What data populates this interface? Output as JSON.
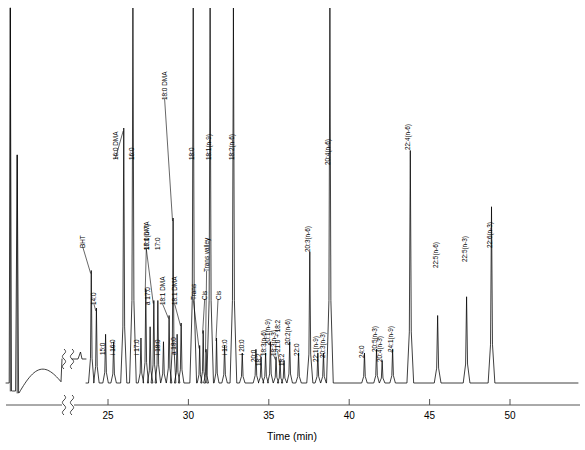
{
  "chart_data": {
    "type": "line",
    "title": "",
    "xlabel": "Time (min)",
    "ylabel": "",
    "xlim": [
      22.2,
      52.8
    ],
    "ylim": [
      0,
      100
    ],
    "grid": false,
    "legend": null,
    "x_ticks": [
      25,
      30,
      35,
      40,
      45,
      50
    ],
    "x_tick_labels": [
      "25",
      "30",
      "35",
      "40",
      "45",
      "50"
    ],
    "axis_break": true,
    "axis_break_note": "broken x-axis between solvent front region and 22.5 min",
    "series_name": "FID response",
    "peaks": [
      {
        "label": "",
        "rt": 22.3,
        "height": 100,
        "clipped": true,
        "width": 0.1
      },
      {
        "label": "",
        "rt": 22.78,
        "height": 88,
        "clipped": true,
        "width": 0.09
      },
      {
        "label": "BHT",
        "rt": 23.96,
        "height": 30,
        "clipped": false,
        "width": 0.09
      },
      {
        "label": "14:0",
        "rt": 24.28,
        "height": 20,
        "clipped": false,
        "width": 0.09
      },
      {
        "label": "15:0",
        "rt": 24.85,
        "height": 13,
        "clipped": false,
        "width": 0.09
      },
      {
        "label": "i 16:0",
        "rt": 25.35,
        "height": 11,
        "clipped": false,
        "width": 0.09
      },
      {
        "label": "16:0 DMA",
        "rt": 25.98,
        "height": 68,
        "clipped": false,
        "width": 0.1
      },
      {
        "label": "16:0",
        "rt": 26.55,
        "height": 100,
        "clipped": true,
        "width": 0.11
      },
      {
        "label": "i 17:0",
        "rt": 27.05,
        "height": 12,
        "clipped": false,
        "width": 0.09
      },
      {
        "label": "17:0 DMA",
        "rt": 27.35,
        "height": 25,
        "clipped": false,
        "width": 0.09
      },
      {
        "label": "a 17:0",
        "rt": 27.62,
        "height": 15,
        "clipped": false,
        "width": 0.09
      },
      {
        "label": "16:1(n-7)",
        "rt": 27.85,
        "height": 22,
        "clipped": false,
        "width": 0.09
      },
      {
        "label": "17:0",
        "rt": 28.1,
        "height": 22,
        "clipped": false,
        "width": 0.09
      },
      {
        "label": "i 18:0",
        "rt": 28.45,
        "height": 11,
        "clipped": false,
        "width": 0.09
      },
      {
        "label": "18:1 DMA",
        "rt": 28.8,
        "height": 18,
        "clipped": false,
        "width": 0.09
      },
      {
        "label": "18:0 DMA",
        "rt": 29.05,
        "height": 44,
        "clipped": false,
        "width": 0.09
      },
      {
        "label": "a 18:0",
        "rt": 29.3,
        "height": 13,
        "clipped": false,
        "width": 0.09
      },
      {
        "label": "18:1 DMA",
        "rt": 29.55,
        "height": 16,
        "clipped": false,
        "width": 0.09
      },
      {
        "label": "18:0",
        "rt": 30.3,
        "height": 100,
        "clipped": true,
        "width": 0.11
      },
      {
        "label": "Trans",
        "rt": 30.7,
        "height": 10,
        "clipped": false,
        "width": 0.08
      },
      {
        "label": "Cis",
        "rt": 30.92,
        "height": 14,
        "clipped": false,
        "width": 0.08
      },
      {
        "label": "Trans valley",
        "rt": 31.1,
        "height": 9,
        "clipped": false,
        "width": 0.08
      },
      {
        "label": "18:1(n-9)",
        "rt": 31.35,
        "height": 100,
        "clipped": true,
        "width": 0.11
      },
      {
        "label": "Cis",
        "rt": 31.75,
        "height": 12,
        "clipped": false,
        "width": 0.08
      },
      {
        "label": "i 19:0",
        "rt": 32.25,
        "height": 10,
        "clipped": false,
        "width": 0.09
      },
      {
        "label": "18:2(n-6)",
        "rt": 32.8,
        "height": 100,
        "clipped": true,
        "width": 0.11
      },
      {
        "label": "i 20:0",
        "rt": 33.35,
        "height": 8,
        "clipped": false,
        "width": 0.09
      },
      {
        "label": "20:0",
        "rt": 34.2,
        "height": 9,
        "clipped": false,
        "width": 0.09
      },
      {
        "label": "18:2",
        "rt": 34.52,
        "height": 7,
        "clipped": false,
        "width": 0.09
      },
      {
        "label": "18:3(n-6)",
        "rt": 34.8,
        "height": 8,
        "clipped": false,
        "width": 0.09
      },
      {
        "label": "20:1(n-9)",
        "rt": 35.1,
        "height": 11,
        "clipped": false,
        "width": 0.09
      },
      {
        "label": "18:3(n-3)",
        "rt": 35.45,
        "height": 7,
        "clipped": false,
        "width": 0.09
      },
      {
        "label": "21:0 + 18:2",
        "rt": 35.7,
        "height": 6,
        "clipped": false,
        "width": 0.09
      },
      {
        "label": "18:2",
        "rt": 35.95,
        "height": 6,
        "clipped": false,
        "width": 0.09
      },
      {
        "label": "20:2(n-6)",
        "rt": 36.3,
        "height": 11,
        "clipped": false,
        "width": 0.09
      },
      {
        "label": "22:0",
        "rt": 36.85,
        "height": 8,
        "clipped": false,
        "width": 0.09
      },
      {
        "label": "20:3(n-6)",
        "rt": 37.55,
        "height": 35,
        "clipped": false,
        "width": 0.1
      },
      {
        "label": "22:1(n-9)",
        "rt": 38.05,
        "height": 8,
        "clipped": false,
        "width": 0.09
      },
      {
        "label": "20:3(n-3)",
        "rt": 38.4,
        "height": 8,
        "clipped": false,
        "width": 0.09
      },
      {
        "label": "20:4(n-6)",
        "rt": 38.8,
        "height": 100,
        "clipped": true,
        "width": 0.11
      },
      {
        "label": "24:0",
        "rt": 40.95,
        "height": 8,
        "clipped": false,
        "width": 0.09
      },
      {
        "label": "20:5(n-3)",
        "rt": 41.7,
        "height": 9,
        "clipped": false,
        "width": 0.09
      },
      {
        "label": "20:4(n-3)",
        "rt": 42.05,
        "height": 6,
        "clipped": false,
        "width": 0.09
      },
      {
        "label": "24:1(n-9)",
        "rt": 42.7,
        "height": 9,
        "clipped": false,
        "width": 0.09
      },
      {
        "label": "22:4(n-6)",
        "rt": 43.8,
        "height": 62,
        "clipped": false,
        "width": 0.11
      },
      {
        "label": "22:5(n-6)",
        "rt": 45.5,
        "height": 18,
        "clipped": false,
        "width": 0.11
      },
      {
        "label": "22:5(n-3)",
        "rt": 47.3,
        "height": 23,
        "clipped": false,
        "width": 0.11
      },
      {
        "label": "22:6(n-3)",
        "rt": 48.85,
        "height": 47,
        "clipped": false,
        "width": 0.11
      }
    ]
  },
  "axis": {
    "x_title": "Time (min)",
    "ticks": [
      "25",
      "30",
      "35",
      "40",
      "45",
      "50"
    ]
  },
  "labels": {
    "bht": "BHT",
    "c14_0": "14:0",
    "c15_0": "15:0",
    "i16_0": "i 16:0",
    "c16_0_dma": "16:0 DMA",
    "c16_0": "16:0",
    "i17_0": "i 17:0",
    "c17_0_dma": "17:0 DMA",
    "a17_0": "a 17:0",
    "c16_1n7": "16:1(n-7)",
    "c17_0": "17:0",
    "i18_0": "i 18:0",
    "c18_1_dma_a": "18:1 DMA",
    "c18_0_dma": "18:0 DMA",
    "a18_0": "a 18:0",
    "c18_1_dma_b": "18:1 DMA",
    "c18_0": "18:0",
    "trans": "Trans",
    "cis_a": "Cis",
    "trans_valley": "Trans valley",
    "c18_1n9": "18:1(n-9)",
    "cis_b": "Cis",
    "cis_c": "Cis",
    "i19_0": "i 19:0",
    "c18_2n6": "18:2(n-6)",
    "i20_0": "i 20:0",
    "c20_0": "20:0",
    "c18_2_a": "18:2",
    "c18_3n6": "18:3(n-6)",
    "c20_1n9": "20:1(n-9)",
    "c18_3n3": "18:3(n-3)",
    "c21_0_18_2": "21:0 + 18:2",
    "c18_2_b": "18:2",
    "c20_2n6": "20:2(n-6)",
    "c22_0": "22:0",
    "c20_3n6": "20:3(n-6)",
    "c22_1n9": "22:1(n-9)",
    "c20_3n3": "20:3(n-3)",
    "c20_4n6": "20:4(n-6)",
    "c24_0": "24:0",
    "c20_5n3": "20:5(n-3)",
    "c20_4n3": "20:4(n-3)",
    "c24_1n9": "24:1(n-9)",
    "c22_4n6": "22:4(n-6)",
    "c22_5n6": "22:5(n-6)",
    "c22_5n3": "22:5(n-3)",
    "c22_6n3": "22:6(n-3)"
  }
}
